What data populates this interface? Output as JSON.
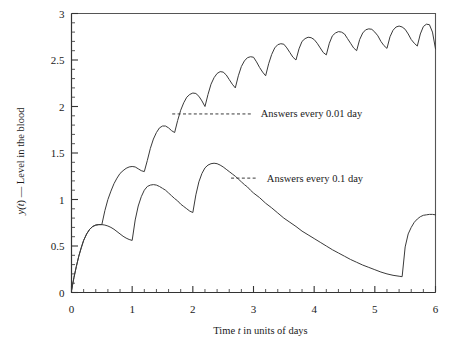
{
  "chart_data": {
    "type": "line",
    "title": "",
    "subtitle": "",
    "xlabel": "Time t in units of days",
    "xlabel_parts": {
      "pre": "Time ",
      "italic": "t",
      "post": " in units of days"
    },
    "ylabel": "y(t) — Level in the blood",
    "ylabel_parts": {
      "pre": "y(",
      "italic": "t",
      "post": ") — Level in the blood"
    },
    "xlim": [
      0,
      6
    ],
    "ylim": [
      0,
      3
    ],
    "xticks": [
      0,
      1,
      2,
      3,
      4,
      5,
      6
    ],
    "xticklabels": [
      "0",
      "1",
      "2",
      "3",
      "4",
      "5",
      "6"
    ],
    "yticks": [
      0,
      0.5,
      1,
      1.5,
      2,
      2.5,
      3
    ],
    "yticklabels": [
      "0",
      "0.5",
      "1",
      "1.5",
      "2",
      "2.5",
      "3"
    ],
    "x_minor_step": 0.2,
    "y_minor_step": 0.1,
    "grid": false,
    "legend_position": "inline-annotations",
    "line_color": "#3a3a3a",
    "frame_color": "#555555",
    "annotations": [
      {
        "text": "Answers every 0.01 day",
        "leader_from": [
          1.66,
          1.92
        ],
        "leader_to": [
          2.96,
          1.92
        ],
        "text_anchor": [
          3.12,
          1.92
        ]
      },
      {
        "text": "Answers every 0.1 day",
        "leader_from": [
          2.63,
          1.23
        ],
        "leader_to": [
          3.06,
          1.23
        ],
        "text_anchor": [
          3.22,
          1.23
        ]
      }
    ],
    "series": [
      {
        "name": "Answers every 0.01 day",
        "description": "Sawtooth drug level: doses every 0.5 day, accumulating toward a steady oscillation between about 2.6 and 2.9",
        "dose_interval": 0.5,
        "points": [
          [
            0.0,
            0.02
          ],
          [
            0.04,
            0.16
          ],
          [
            0.08,
            0.28
          ],
          [
            0.12,
            0.39
          ],
          [
            0.16,
            0.48
          ],
          [
            0.2,
            0.56
          ],
          [
            0.25,
            0.63
          ],
          [
            0.3,
            0.68
          ],
          [
            0.35,
            0.71
          ],
          [
            0.4,
            0.725
          ],
          [
            0.45,
            0.73
          ],
          [
            0.5,
            0.73
          ],
          [
            0.5,
            0.73
          ],
          [
            0.55,
            0.88
          ],
          [
            0.6,
            1.0
          ],
          [
            0.65,
            1.09
          ],
          [
            0.7,
            1.17
          ],
          [
            0.75,
            1.23
          ],
          [
            0.8,
            1.28
          ],
          [
            0.85,
            1.31
          ],
          [
            0.9,
            1.335
          ],
          [
            0.95,
            1.35
          ],
          [
            1.0,
            1.355
          ],
          [
            1.05,
            1.35
          ],
          [
            1.1,
            1.33
          ],
          [
            1.15,
            1.31
          ],
          [
            1.2,
            1.3
          ],
          [
            1.2,
            1.3
          ],
          [
            1.25,
            1.42
          ],
          [
            1.3,
            1.55
          ],
          [
            1.35,
            1.65
          ],
          [
            1.4,
            1.72
          ],
          [
            1.45,
            1.77
          ],
          [
            1.5,
            1.79
          ],
          [
            1.55,
            1.79
          ],
          [
            1.6,
            1.77
          ],
          [
            1.65,
            1.74
          ],
          [
            1.7,
            1.72
          ],
          [
            1.7,
            1.72
          ],
          [
            1.75,
            1.85
          ],
          [
            1.8,
            1.96
          ],
          [
            1.85,
            2.04
          ],
          [
            1.9,
            2.1
          ],
          [
            1.95,
            2.13
          ],
          [
            2.0,
            2.145
          ],
          [
            2.05,
            2.14
          ],
          [
            2.1,
            2.11
          ],
          [
            2.15,
            2.06
          ],
          [
            2.2,
            2.0
          ],
          [
            2.2,
            2.0
          ],
          [
            2.25,
            2.13
          ],
          [
            2.3,
            2.24
          ],
          [
            2.35,
            2.31
          ],
          [
            2.4,
            2.355
          ],
          [
            2.45,
            2.375
          ],
          [
            2.5,
            2.37
          ],
          [
            2.55,
            2.34
          ],
          [
            2.6,
            2.29
          ],
          [
            2.65,
            2.24
          ],
          [
            2.7,
            2.2
          ],
          [
            2.7,
            2.2
          ],
          [
            2.75,
            2.33
          ],
          [
            2.8,
            2.43
          ],
          [
            2.85,
            2.49
          ],
          [
            2.9,
            2.525
          ],
          [
            2.95,
            2.535
          ],
          [
            3.0,
            2.53
          ],
          [
            3.05,
            2.48
          ],
          [
            3.1,
            2.42
          ],
          [
            3.15,
            2.37
          ],
          [
            3.2,
            2.33
          ],
          [
            3.2,
            2.33
          ],
          [
            3.25,
            2.46
          ],
          [
            3.3,
            2.56
          ],
          [
            3.35,
            2.63
          ],
          [
            3.4,
            2.665
          ],
          [
            3.45,
            2.675
          ],
          [
            3.5,
            2.67
          ],
          [
            3.55,
            2.63
          ],
          [
            3.6,
            2.58
          ],
          [
            3.65,
            2.53
          ],
          [
            3.7,
            2.5
          ],
          [
            3.7,
            2.5
          ],
          [
            3.75,
            2.62
          ],
          [
            3.8,
            2.7
          ],
          [
            3.85,
            2.73
          ],
          [
            3.9,
            2.745
          ],
          [
            3.95,
            2.74
          ],
          [
            4.0,
            2.72
          ],
          [
            4.05,
            2.68
          ],
          [
            4.1,
            2.63
          ],
          [
            4.15,
            2.58
          ],
          [
            4.2,
            2.555
          ],
          [
            4.2,
            2.555
          ],
          [
            4.25,
            2.68
          ],
          [
            4.3,
            2.76
          ],
          [
            4.35,
            2.79
          ],
          [
            4.4,
            2.805
          ],
          [
            4.45,
            2.8
          ],
          [
            4.5,
            2.78
          ],
          [
            4.55,
            2.73
          ],
          [
            4.6,
            2.68
          ],
          [
            4.65,
            2.63
          ],
          [
            4.7,
            2.6
          ],
          [
            4.7,
            2.6
          ],
          [
            4.75,
            2.72
          ],
          [
            4.8,
            2.79
          ],
          [
            4.85,
            2.825
          ],
          [
            4.9,
            2.835
          ],
          [
            4.95,
            2.83
          ],
          [
            5.0,
            2.8
          ],
          [
            5.05,
            2.76
          ],
          [
            5.1,
            2.7
          ],
          [
            5.15,
            2.655
          ],
          [
            5.2,
            2.625
          ],
          [
            5.2,
            2.625
          ],
          [
            5.25,
            2.75
          ],
          [
            5.3,
            2.82
          ],
          [
            5.35,
            2.855
          ],
          [
            5.4,
            2.865
          ],
          [
            5.45,
            2.855
          ],
          [
            5.5,
            2.83
          ],
          [
            5.55,
            2.78
          ],
          [
            5.6,
            2.72
          ],
          [
            5.65,
            2.68
          ],
          [
            5.7,
            2.65
          ],
          [
            5.7,
            2.65
          ],
          [
            5.75,
            2.78
          ],
          [
            5.8,
            2.86
          ],
          [
            5.85,
            2.885
          ],
          [
            5.9,
            2.88
          ],
          [
            5.95,
            2.8
          ],
          [
            6.0,
            2.62
          ]
        ]
      },
      {
        "name": "Answers every 0.1 day",
        "description": "Coarser step size: fewer effective doses; level peaks near 1.39 at t=2.35 then decays to about 0.17 at t=5.45 before a final rise to 0.84",
        "dose_interval": 1.0,
        "points": [
          [
            0.0,
            0.02
          ],
          [
            0.04,
            0.16
          ],
          [
            0.08,
            0.28
          ],
          [
            0.12,
            0.39
          ],
          [
            0.16,
            0.48
          ],
          [
            0.2,
            0.56
          ],
          [
            0.25,
            0.63
          ],
          [
            0.3,
            0.68
          ],
          [
            0.35,
            0.71
          ],
          [
            0.4,
            0.725
          ],
          [
            0.45,
            0.73
          ],
          [
            0.5,
            0.73
          ],
          [
            0.55,
            0.725
          ],
          [
            0.6,
            0.715
          ],
          [
            0.65,
            0.7
          ],
          [
            0.7,
            0.68
          ],
          [
            0.75,
            0.655
          ],
          [
            0.8,
            0.63
          ],
          [
            0.85,
            0.605
          ],
          [
            0.9,
            0.585
          ],
          [
            0.95,
            0.57
          ],
          [
            1.0,
            0.56
          ],
          [
            1.0,
            0.56
          ],
          [
            1.05,
            0.78
          ],
          [
            1.1,
            0.93
          ],
          [
            1.15,
            1.03
          ],
          [
            1.2,
            1.1
          ],
          [
            1.25,
            1.14
          ],
          [
            1.3,
            1.155
          ],
          [
            1.35,
            1.16
          ],
          [
            1.4,
            1.155
          ],
          [
            1.45,
            1.14
          ],
          [
            1.5,
            1.12
          ],
          [
            1.55,
            1.1
          ],
          [
            1.6,
            1.07
          ],
          [
            1.65,
            1.04
          ],
          [
            1.7,
            1.01
          ],
          [
            1.75,
            0.985
          ],
          [
            1.8,
            0.95
          ],
          [
            1.85,
            0.925
          ],
          [
            1.9,
            0.9
          ],
          [
            1.95,
            0.875
          ],
          [
            2.0,
            0.86
          ],
          [
            2.0,
            0.86
          ],
          [
            2.05,
            1.05
          ],
          [
            2.1,
            1.19
          ],
          [
            2.15,
            1.28
          ],
          [
            2.2,
            1.34
          ],
          [
            2.25,
            1.37
          ],
          [
            2.3,
            1.385
          ],
          [
            2.35,
            1.39
          ],
          [
            2.4,
            1.385
          ],
          [
            2.45,
            1.37
          ],
          [
            2.5,
            1.35
          ],
          [
            2.55,
            1.325
          ],
          [
            2.6,
            1.3
          ],
          [
            2.65,
            1.275
          ],
          [
            2.7,
            1.25
          ],
          [
            2.75,
            1.22
          ],
          [
            2.8,
            1.19
          ],
          [
            2.85,
            1.16
          ],
          [
            2.9,
            1.135
          ],
          [
            2.95,
            1.1
          ],
          [
            3.0,
            1.07
          ],
          [
            3.1,
            1.02
          ],
          [
            3.2,
            0.96
          ],
          [
            3.3,
            0.91
          ],
          [
            3.4,
            0.855
          ],
          [
            3.5,
            0.8
          ],
          [
            3.6,
            0.755
          ],
          [
            3.7,
            0.71
          ],
          [
            3.8,
            0.66
          ],
          [
            3.9,
            0.62
          ],
          [
            4.0,
            0.58
          ],
          [
            4.1,
            0.54
          ],
          [
            4.2,
            0.5
          ],
          [
            4.3,
            0.46
          ],
          [
            4.4,
            0.425
          ],
          [
            4.5,
            0.39
          ],
          [
            4.6,
            0.355
          ],
          [
            4.7,
            0.325
          ],
          [
            4.8,
            0.295
          ],
          [
            4.9,
            0.27
          ],
          [
            5.0,
            0.245
          ],
          [
            5.1,
            0.22
          ],
          [
            5.2,
            0.2
          ],
          [
            5.3,
            0.185
          ],
          [
            5.4,
            0.175
          ],
          [
            5.45,
            0.17
          ],
          [
            5.45,
            0.17
          ],
          [
            5.5,
            0.49
          ],
          [
            5.55,
            0.63
          ],
          [
            5.6,
            0.7
          ],
          [
            5.65,
            0.755
          ],
          [
            5.7,
            0.79
          ],
          [
            5.75,
            0.815
          ],
          [
            5.8,
            0.83
          ],
          [
            5.85,
            0.835
          ],
          [
            5.9,
            0.84
          ],
          [
            5.95,
            0.84
          ],
          [
            6.0,
            0.835
          ]
        ]
      }
    ]
  }
}
